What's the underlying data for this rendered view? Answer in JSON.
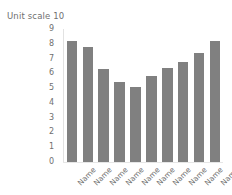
{
  "chart_data": {
    "type": "bar",
    "title": "Unit scale 10",
    "xlabel": "",
    "ylabel": "",
    "categories": [
      "Name",
      "Name",
      "Name",
      "Name",
      "Name",
      "Name",
      "Name",
      "Name",
      "Name",
      "Name"
    ],
    "values": [
      8.2,
      7.8,
      6.3,
      5.4,
      5.05,
      5.8,
      6.35,
      6.75,
      7.4,
      8.2
    ],
    "ylim": [
      0,
      9
    ],
    "ytick_labels": [
      "9",
      "8",
      "7",
      "6",
      "5",
      "4",
      "3",
      "2",
      "1",
      "0"
    ],
    "ytick_values": [
      9,
      8,
      7,
      6,
      5,
      4,
      3,
      2,
      1,
      0
    ],
    "grid": false,
    "legend": null,
    "bar_color": "#808080",
    "text_color": "#6f6f6f",
    "background_color": "#ffffff",
    "xlabel_rotation": "-45"
  }
}
